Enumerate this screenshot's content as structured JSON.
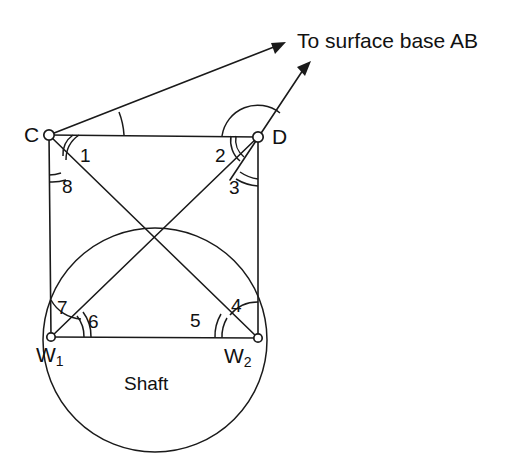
{
  "figure": {
    "title_annotation": "To surface base AB",
    "shaft_caption": "Shaft",
    "background_color": "#ffffff",
    "ink_color": "#1a1a1a"
  },
  "vertices": [
    {
      "id": "C",
      "label": "C",
      "sub": "",
      "x": 49,
      "y": 135
    },
    {
      "id": "D",
      "label": "D",
      "sub": "",
      "x": 258,
      "y": 137
    },
    {
      "id": "W1",
      "label": "W",
      "sub": "1",
      "x": 51,
      "y": 337
    },
    {
      "id": "W2",
      "label": "W",
      "sub": "2",
      "x": 258,
      "y": 338
    }
  ],
  "angles": [
    {
      "id": "a1",
      "label": "1",
      "vertex": "C",
      "x": 80,
      "y": 146
    },
    {
      "id": "a2",
      "label": "2",
      "vertex": "D",
      "x": 215,
      "y": 146
    },
    {
      "id": "a3",
      "label": "3",
      "vertex": "D",
      "x": 229,
      "y": 178
    },
    {
      "id": "a4",
      "label": "4",
      "vertex": "W2",
      "x": 231,
      "y": 296
    },
    {
      "id": "a5",
      "label": "5",
      "vertex": "W2",
      "x": 190,
      "y": 311
    },
    {
      "id": "a6",
      "label": "6",
      "vertex": "W1",
      "x": 88,
      "y": 312
    },
    {
      "id": "a7",
      "label": "7",
      "vertex": "W1",
      "x": 57,
      "y": 298
    },
    {
      "id": "a8",
      "label": "8",
      "vertex": "C",
      "x": 62,
      "y": 177
    }
  ],
  "shaft_circle": {
    "center_x": 155,
    "center_y": 340,
    "radius": 112
  },
  "arrows": [
    {
      "id": "arrow-from-C",
      "from": "C",
      "tip_x": 286,
      "tip_y": 42
    },
    {
      "id": "arrow-from-D",
      "from": "D",
      "tip_x": 311,
      "tip_y": 61
    }
  ],
  "annotation_label": {
    "text": "To surface base AB",
    "x": 297,
    "y": 30
  },
  "shaft_label": {
    "text": "Shaft",
    "x": 124,
    "y": 374
  }
}
